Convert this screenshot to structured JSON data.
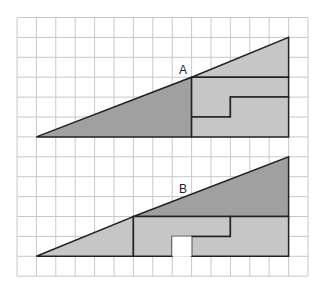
{
  "grid": {
    "cols": 15,
    "rows": 13,
    "x0": 17,
    "y0": 17.5,
    "cw": 19.4,
    "ch": 19.9,
    "color": "#c8c8c8"
  },
  "colors": {
    "dark": "#a0a0a0",
    "light": "#c6c6c6",
    "stroke": "#222222"
  },
  "figures": [
    {
      "label": "A",
      "label_pos": [
        184,
        72
      ]
    },
    {
      "label": "B",
      "label_pos": [
        184,
        192
      ]
    }
  ]
}
